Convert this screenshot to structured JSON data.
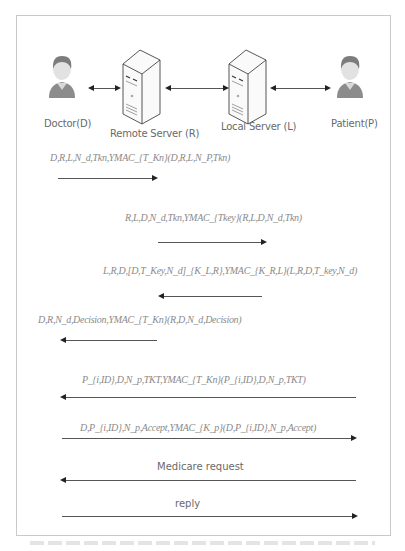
{
  "diagram": {
    "entities": [
      {
        "id": "doctor",
        "label": "Doctor(D)",
        "icon": "person-icon"
      },
      {
        "id": "remote",
        "label": "Remote Server (R)",
        "icon": "server-icon"
      },
      {
        "id": "local",
        "label": "Local Server (L)",
        "icon": "server-icon"
      },
      {
        "id": "patient",
        "label": "Patient(P)",
        "icon": "person-icon"
      }
    ],
    "links": [
      {
        "from": "Doctor(D)",
        "to": "Remote Server (R)",
        "type": "bidirectional"
      },
      {
        "from": "Remote Server (R)",
        "to": "Local Server (L)",
        "type": "bidirectional"
      },
      {
        "from": "Local Server (L)",
        "to": "Patient(P)",
        "type": "bidirectional"
      }
    ],
    "messages": [
      {
        "text": "D,R,L,N_d,Tkn,YMAC_{T_Kn}(D,R,L,N_P,Tkn)",
        "direction": "right"
      },
      {
        "text": "R,L,D,N_d,Tkn,YMAC_{Tkey}(R,L,D,N_d,Tkn)",
        "direction": "right"
      },
      {
        "text": "L,R,D,[D,T_Key,N_d]_{K_L,R},YMAC_{K_R,L}(L,R,D,T_key,N_d)",
        "direction": "left"
      },
      {
        "text": "D,R,N_d,Decision,YMAC_{T_Kn}(R,D,N_d,Decision)",
        "direction": "left"
      },
      {
        "text": "P_{i,ID},D,N_p,TKT,YMAC_{T_Kn}(P_{i,ID},D,N_p,TKT)",
        "direction": "left"
      },
      {
        "text": "D,P_{i,ID},N_p,Accept,YMAC_{K_p}(D,P_{i,ID},N_p,Accept)",
        "direction": "right"
      },
      {
        "text": "Medicare request",
        "direction": "left"
      },
      {
        "text": "reply",
        "direction": "right"
      }
    ]
  }
}
